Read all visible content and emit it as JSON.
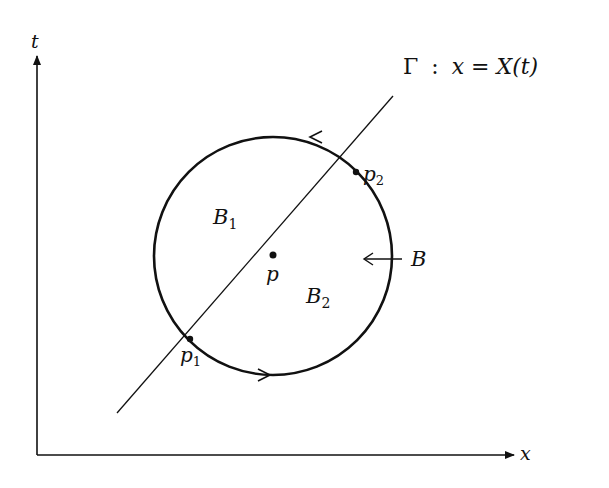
{
  "diagram": {
    "axes": {
      "vertical_label": "t",
      "horizontal_label": "x"
    },
    "curve_label": {
      "gamma": "Γ",
      "colon": ":",
      "equation": "x = X(t)"
    },
    "regions": {
      "upper": {
        "base": "B",
        "sub": "1"
      },
      "lower": {
        "base": "B",
        "sub": "2"
      }
    },
    "points": {
      "center": "p",
      "lower_intersection": {
        "base": "p",
        "sub": "1"
      },
      "upper_intersection": {
        "base": "p",
        "sub": "2"
      }
    },
    "boundary_label": "B",
    "orientation": "counterclockwise",
    "colors": {
      "ink": "#111111",
      "background": "#ffffff"
    }
  }
}
